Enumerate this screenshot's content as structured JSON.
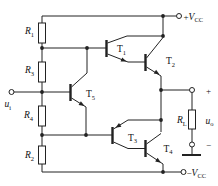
{
  "colors": {
    "line": "#222222",
    "text": "#111111",
    "background": "#ffffff"
  },
  "labels": {
    "r1": {
      "base": "R",
      "sub": "1"
    },
    "r3": {
      "base": "R",
      "sub": "3"
    },
    "r4": {
      "base": "R",
      "sub": "4"
    },
    "r2": {
      "base": "R",
      "sub": "2"
    },
    "rl": {
      "base": "R",
      "sub": "L"
    },
    "t1": {
      "base": "T",
      "sub": "1"
    },
    "t2": {
      "base": "T",
      "sub": "2"
    },
    "t3": {
      "base": "T",
      "sub": "3"
    },
    "t4": {
      "base": "T",
      "sub": "4"
    },
    "t5": {
      "base": "T",
      "sub": "5"
    },
    "vcc_plus": {
      "sign": "+",
      "base": "V",
      "sub": "CC"
    },
    "vcc_minus": {
      "sign": "−",
      "base": "V",
      "sub": "CC"
    },
    "u_i": {
      "base": "u",
      "sub": "i"
    },
    "u_o": {
      "base": "u",
      "sub": "o"
    },
    "out_plus": "+",
    "out_minus": "−"
  },
  "components": {
    "resistors": [
      "R1",
      "R3",
      "R4",
      "R2",
      "RL"
    ],
    "transistors": [
      {
        "name": "T1",
        "type": "npn"
      },
      {
        "name": "T2",
        "type": "npn"
      },
      {
        "name": "T3",
        "type": "pnp"
      },
      {
        "name": "T4",
        "type": "npn"
      },
      {
        "name": "T5",
        "type": "npn"
      }
    ],
    "terminals": [
      "+VCC",
      "−VCC",
      "ui",
      "uo+",
      "uo−",
      "ground"
    ]
  }
}
